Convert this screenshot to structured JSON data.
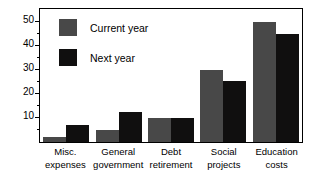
{
  "chart_data": {
    "type": "bar",
    "title": "",
    "xlabel": "",
    "ylabel": "",
    "ylim": [
      0,
      55
    ],
    "yticks": [
      10,
      20,
      30,
      40,
      50
    ],
    "ytick_labels": [
      "50",
      "40",
      "30",
      "20",
      "10"
    ],
    "grid": false,
    "legend_position": "top-left",
    "categories": [
      "Misc. expenses",
      "General government",
      "Debt retirement",
      "Social projects",
      "Education costs"
    ],
    "category_lines": [
      [
        "Misc.",
        "expenses"
      ],
      [
        "General",
        "government"
      ],
      [
        "Debt",
        "retirement"
      ],
      [
        "Social",
        "projects"
      ],
      [
        "Education",
        "costs"
      ]
    ],
    "series": [
      {
        "name": "Current year",
        "color": "#484848",
        "values": [
          2,
          5,
          10,
          30,
          50
        ]
      },
      {
        "name": "Next year",
        "color": "#100f0f",
        "values": [
          7,
          12.5,
          10,
          25.5,
          45
        ]
      }
    ]
  },
  "legend": {
    "items": [
      {
        "label": "Current year",
        "color": "#484848"
      },
      {
        "label": "Next year",
        "color": "#100f0f"
      }
    ]
  },
  "axis": {
    "y_labels": [
      "50",
      "40",
      "30",
      "20",
      "10"
    ]
  }
}
